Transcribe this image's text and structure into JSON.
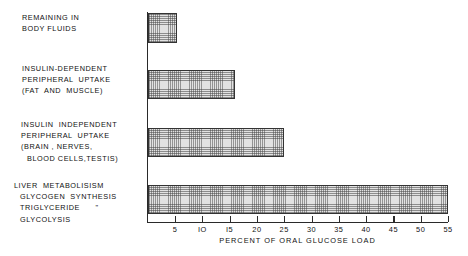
{
  "chart_data": {
    "type": "bar",
    "orientation": "horizontal",
    "title": "",
    "xlabel": "PERCENT OF ORAL GLUCOSE LOAD",
    "ylabel": "",
    "xlim": [
      0,
      55
    ],
    "grid": false,
    "legend": null,
    "xticks": [
      5,
      10,
      15,
      20,
      25,
      30,
      35,
      40,
      45,
      50,
      55
    ],
    "xtick_labels": [
      "5",
      "IO",
      "I5",
      "20",
      "25",
      "30",
      "35",
      "40",
      "45",
      "50",
      "55"
    ],
    "categories": [
      "REMAINING IN BODY FLUIDS",
      "INSULIN-DEPENDENT PERIPHERAL UPTAKE (FAT AND MUSCLE)",
      "INSULIN INDEPENDENT PERIPHERAL UPTAKE (BRAIN, NERVES, BLOOD CELLS,TESTIS)",
      "LIVER METABOLISISM GLYCOGEN SYNTHESIS TRIGLYCERIDE \" GLYCOLYSIS"
    ],
    "values": [
      5.3,
      16,
      25,
      55
    ]
  },
  "labels": [
    {
      "name": "remaining-in-body-fluids",
      "lines": [
        "REMAINING IN",
        "BODY FLUIDS"
      ],
      "indents": [
        0,
        0
      ]
    },
    {
      "name": "insulin-dependent-peripheral-uptake",
      "lines": [
        "INSULIN-DEPENDENT",
        "PERIPHERAL  UPTAKE",
        "(FAT  AND  MUSCLE)"
      ],
      "indents": [
        0,
        0,
        0
      ]
    },
    {
      "name": "insulin-independent-peripheral-uptake",
      "lines": [
        "INSULIN  INDEPENDENT",
        "PERIPHERAL  UPTAKE",
        "(BRAIN , NERVES,",
        "BLOOD CELLS,TESTIS)"
      ],
      "indents": [
        0,
        0,
        0,
        1
      ]
    },
    {
      "name": "liver-metabolisism",
      "lines": [
        "LIVER  METABOLISISM",
        "GLYCOGEN  SYNTHESIS",
        "TRIGLYCERIDE      \"",
        "GLYCOLYSIS"
      ],
      "indents": [
        0,
        1,
        1,
        1
      ]
    }
  ],
  "axis": {
    "caption": "PERCENT  OF  ORAL  GLUCOSE  LOAD",
    "tick_values": [
      5,
      10,
      15,
      20,
      25,
      30,
      35,
      40,
      45,
      50,
      55
    ],
    "tick_labels": [
      "5",
      "IO",
      "I5",
      "20",
      "25",
      "30",
      "35",
      "40",
      "45",
      "50",
      "55"
    ]
  },
  "bars": [
    {
      "name": "bar-remaining-in-body-fluids",
      "value": 5.3
    },
    {
      "name": "bar-insulin-dependent-peripheral-uptake",
      "value": 16
    },
    {
      "name": "bar-insulin-independent-peripheral-uptake",
      "value": 25
    },
    {
      "name": "bar-liver-metabolisism",
      "value": 55
    }
  ],
  "colors": {
    "axis": "#2a2a2a",
    "bar_outline": "#333333",
    "bar_fill": "#e2e2e2",
    "text": "#111111",
    "background": "#ffffff"
  }
}
